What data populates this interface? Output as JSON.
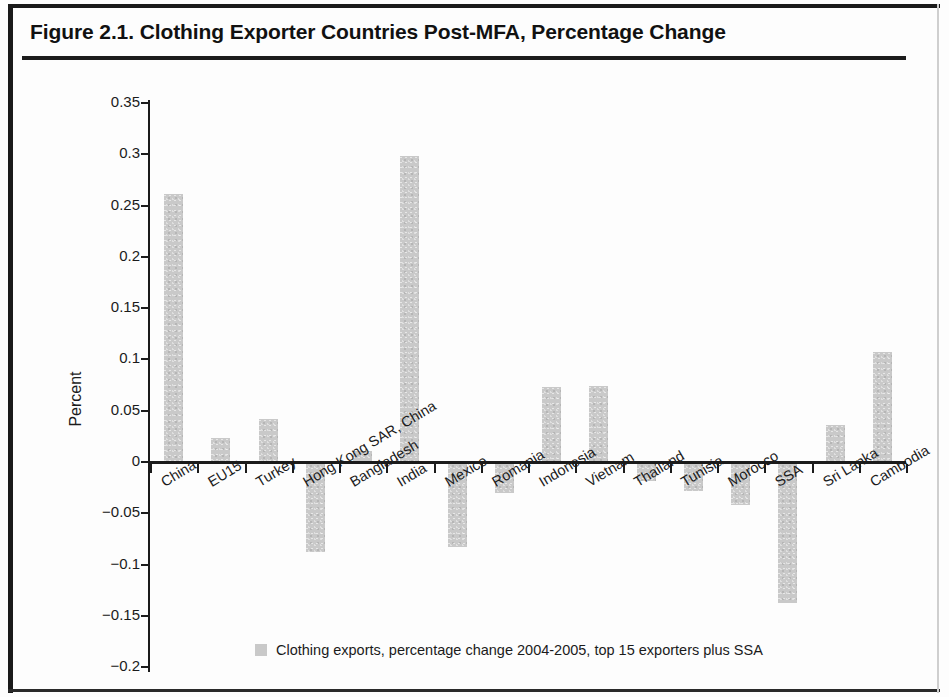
{
  "figure": {
    "title": "Figure 2.1. Clothing Exporter Countries Post-MFA, Percentage Change"
  },
  "legend": {
    "label": "Clothing exports, percentage change 2004-2005, top 15 exporters plus SSA",
    "swatch_color": "#c9c9c9"
  },
  "axis": {
    "ylabel": "Percent",
    "yticks": [
      "0.35",
      "0.3",
      "0.25",
      "0.2",
      "0.15",
      "0.1",
      "0.05",
      "0",
      "−0.05",
      "−0.1",
      "−0.15",
      "−0.2"
    ]
  },
  "chart_data": {
    "type": "bar",
    "title": "Figure 2.1. Clothing Exporter Countries Post-MFA, Percentage Change",
    "xlabel": "",
    "ylabel": "Percent",
    "ylim": [
      -0.2,
      0.35
    ],
    "ytick_values": [
      0.35,
      0.3,
      0.25,
      0.2,
      0.15,
      0.1,
      0.05,
      0,
      -0.05,
      -0.1,
      -0.15,
      -0.2
    ],
    "grid": false,
    "legend_position": "bottom-center",
    "bar_color": "#c9c9c9",
    "categories": [
      "China",
      "EU15",
      "Turkey",
      "Hong Kong SAR, China",
      "Bangladesh",
      "India",
      "Mexico",
      "Romania",
      "Indonesia",
      "Vietnam",
      "Thailand",
      "Tunisia",
      "Morocco",
      "SSA",
      "Sri Lanka",
      "Cambodia"
    ],
    "series": [
      {
        "name": "Clothing exports, percentage change 2004-2005, top 15 exporters plus SSA",
        "values": [
          0.261,
          0.023,
          0.042,
          -0.088,
          0.011,
          0.298,
          -0.083,
          -0.03,
          0.073,
          0.074,
          -0.019,
          -0.028,
          -0.042,
          -0.137,
          0.036,
          0.107
        ]
      }
    ]
  }
}
